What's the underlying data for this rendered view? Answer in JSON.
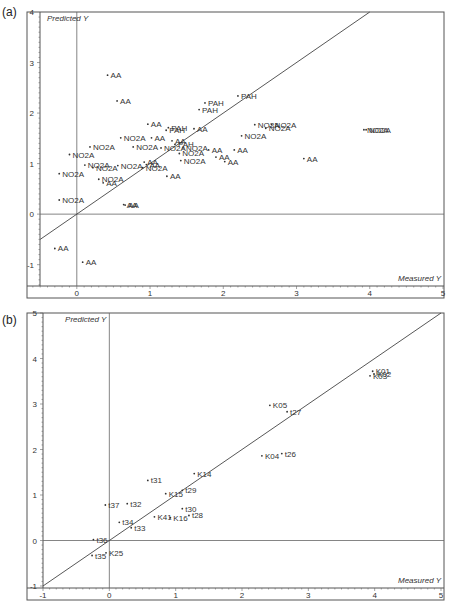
{
  "figure": {
    "panels": [
      {
        "id": "a",
        "label": "(a)"
      },
      {
        "id": "b",
        "label": "(b)"
      }
    ]
  },
  "chart_data": [
    {
      "panel": "(a)",
      "type": "scatter",
      "title": "",
      "xlabel": "Measured Y",
      "ylabel": "Predicted Y",
      "xlim": [
        -0.68,
        5
      ],
      "ylim": [
        -1.62,
        4
      ],
      "xticks": [
        0,
        1,
        2,
        3,
        4,
        5
      ],
      "yticks": [
        -1,
        0,
        1,
        2,
        3,
        4
      ],
      "grid": false,
      "reference_lines": [
        "x=0",
        "y=0",
        "y=x"
      ],
      "points": [
        {
          "label": "AA",
          "x": 0.42,
          "y": 2.75
        },
        {
          "label": "AA",
          "x": 0.55,
          "y": 2.24
        },
        {
          "label": "PAH",
          "x": 1.75,
          "y": 2.2
        },
        {
          "label": "PAH",
          "x": 1.67,
          "y": 2.07
        },
        {
          "label": "PAH",
          "x": 2.2,
          "y": 2.34
        },
        {
          "label": "AA",
          "x": 0.97,
          "y": 1.78
        },
        {
          "label": "PAH",
          "x": 1.25,
          "y": 1.71
        },
        {
          "label": "PAH",
          "x": 1.22,
          "y": 1.66
        },
        {
          "label": "AA",
          "x": 1.6,
          "y": 1.69
        },
        {
          "label": "NO2A",
          "x": 0.6,
          "y": 1.51
        },
        {
          "label": "AA",
          "x": 1.02,
          "y": 1.51
        },
        {
          "label": "AA",
          "x": 1.3,
          "y": 1.45
        },
        {
          "label": "PAH",
          "x": 1.34,
          "y": 1.38
        },
        {
          "label": "NO2A",
          "x": 0.77,
          "y": 1.33
        },
        {
          "label": "NO2A",
          "x": 1.15,
          "y": 1.31
        },
        {
          "label": "NO2A",
          "x": 1.45,
          "y": 1.31
        },
        {
          "label": "NO2A",
          "x": 1.4,
          "y": 1.2
        },
        {
          "label": "NO2A",
          "x": 1.42,
          "y": 1.06
        },
        {
          "label": "NO2A",
          "x": 0.18,
          "y": 1.33
        },
        {
          "label": "NO2A",
          "x": -0.1,
          "y": 1.18
        },
        {
          "label": "NO2A",
          "x": 0.11,
          "y": 0.97
        },
        {
          "label": "NO2A",
          "x": -0.24,
          "y": 0.8
        },
        {
          "label": "NO2A",
          "x": 0.22,
          "y": 0.92
        },
        {
          "label": "NO2A",
          "x": 0.56,
          "y": 0.96
        },
        {
          "label": "NO2A",
          "x": 0.3,
          "y": 0.69
        },
        {
          "label": "AA",
          "x": 0.36,
          "y": 0.62
        },
        {
          "label": "AA",
          "x": 0.92,
          "y": 1.03
        },
        {
          "label": "AA",
          "x": 0.95,
          "y": 0.98
        },
        {
          "label": "NO2A",
          "x": 0.9,
          "y": 0.92
        },
        {
          "label": "AA",
          "x": 1.23,
          "y": 0.75
        },
        {
          "label": "NO2A",
          "x": -0.24,
          "y": 0.28
        },
        {
          "label": "AA",
          "x": 0.64,
          "y": 0.19
        },
        {
          "label": "AA",
          "x": 0.66,
          "y": 0.18
        },
        {
          "label": "AA",
          "x": 1.8,
          "y": 1.27
        },
        {
          "label": "AA",
          "x": 1.9,
          "y": 1.13
        },
        {
          "label": "AA",
          "x": 2.02,
          "y": 1.04
        },
        {
          "label": "AA",
          "x": 2.15,
          "y": 1.27
        },
        {
          "label": "AA",
          "x": 3.1,
          "y": 1.1
        },
        {
          "label": "NO2A",
          "x": 2.25,
          "y": 1.55
        },
        {
          "label": "NO2A",
          "x": 2.43,
          "y": 1.77
        },
        {
          "label": "NO2A",
          "x": 2.66,
          "y": 1.77
        },
        {
          "label": "NO2A",
          "x": 2.58,
          "y": 1.7
        },
        {
          "label": "NO2A",
          "x": 3.92,
          "y": 1.67
        },
        {
          "label": "NO2A",
          "x": 3.95,
          "y": 1.67
        },
        {
          "label": "AA",
          "x": -0.3,
          "y": -0.68
        },
        {
          "label": "AA",
          "x": 0.08,
          "y": -0.95
        }
      ]
    },
    {
      "panel": "(b)",
      "type": "scatter",
      "title": "",
      "xlabel": "Measured Y",
      "ylabel": "Predicted Y",
      "xlim": [
        -1,
        5
      ],
      "ylim": [
        -1,
        5
      ],
      "xticks": [
        -1,
        0,
        1,
        2,
        3,
        4,
        5
      ],
      "yticks": [
        -1,
        0,
        1,
        2,
        3,
        4,
        5
      ],
      "grid": false,
      "reference_lines": [
        "x=0",
        "y=0",
        "y=x"
      ],
      "points": [
        {
          "label": "K01",
          "x": 3.97,
          "y": 3.72
        },
        {
          "label": "K02",
          "x": 3.99,
          "y": 3.66
        },
        {
          "label": "K03",
          "x": 3.93,
          "y": 3.62
        },
        {
          "label": "K05",
          "x": 2.42,
          "y": 2.97
        },
        {
          "label": "t27",
          "x": 2.68,
          "y": 2.83
        },
        {
          "label": "K04",
          "x": 2.3,
          "y": 1.86
        },
        {
          "label": "t26",
          "x": 2.6,
          "y": 1.91
        },
        {
          "label": "K14",
          "x": 1.28,
          "y": 1.47
        },
        {
          "label": "t31",
          "x": 0.58,
          "y": 1.32
        },
        {
          "label": "K15",
          "x": 0.85,
          "y": 1.03
        },
        {
          "label": "t29",
          "x": 1.1,
          "y": 1.1
        },
        {
          "label": "t37",
          "x": -0.06,
          "y": 0.78
        },
        {
          "label": "t32",
          "x": 0.27,
          "y": 0.81
        },
        {
          "label": "t30",
          "x": 1.1,
          "y": 0.7
        },
        {
          "label": "t28",
          "x": 1.2,
          "y": 0.55
        },
        {
          "label": "K41",
          "x": 0.68,
          "y": 0.52
        },
        {
          "label": "K16",
          "x": 0.92,
          "y": 0.5
        },
        {
          "label": "t34",
          "x": 0.15,
          "y": 0.4
        },
        {
          "label": "t33",
          "x": 0.33,
          "y": 0.28
        },
        {
          "label": "t36",
          "x": -0.24,
          "y": 0.02
        },
        {
          "label": "t35",
          "x": -0.26,
          "y": -0.33
        },
        {
          "label": "K25",
          "x": -0.05,
          "y": -0.27
        }
      ]
    }
  ]
}
